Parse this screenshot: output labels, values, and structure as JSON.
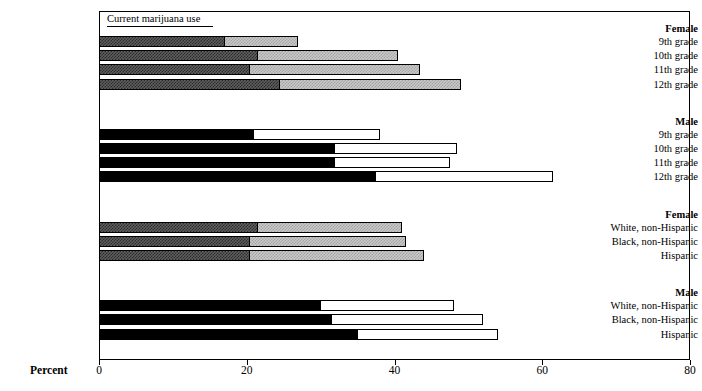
{
  "legend": {
    "label": "Current marijuana use"
  },
  "axis": {
    "xlabel": "Percent",
    "ticks": [
      {
        "value": 0,
        "text": "0"
      },
      {
        "value": 20,
        "text": "20"
      },
      {
        "value": 40,
        "text": "40"
      },
      {
        "value": 60,
        "text": "60"
      },
      {
        "value": 80,
        "text": "80"
      }
    ],
    "xmin": 0,
    "xmax": 80
  },
  "colors": {
    "female_dark": "#3f3f3f",
    "female_light": "#c0c0c0",
    "male_dark": "#000000",
    "male_light": "#ffffff",
    "outline": "#000000",
    "background": "#ffffff"
  },
  "groups": [
    {
      "id": "female-grade",
      "heading": "Female",
      "sex": "female",
      "rows": [
        {
          "label": "9th grade",
          "dark": 17.0,
          "light": 27.0
        },
        {
          "label": "10th grade",
          "dark": 21.5,
          "light": 40.5
        },
        {
          "label": "11th grade",
          "dark": 20.5,
          "light": 43.5
        },
        {
          "label": "12th grade",
          "dark": 24.5,
          "light": 49.0
        }
      ]
    },
    {
      "id": "male-grade",
      "heading": "Male",
      "sex": "male",
      "rows": [
        {
          "label": "9th grade",
          "dark": 21.0,
          "light": 38.0
        },
        {
          "label": "10th grade",
          "dark": 32.0,
          "light": 48.5
        },
        {
          "label": "11th grade",
          "dark": 32.0,
          "light": 47.5
        },
        {
          "label": "12th grade",
          "dark": 37.5,
          "light": 61.5
        }
      ]
    },
    {
      "id": "female-race",
      "heading": "Female",
      "sex": "female",
      "rows": [
        {
          "label": "White, non-Hispanic",
          "dark": 21.5,
          "light": 41.0
        },
        {
          "label": "Black, non-Hispanic",
          "dark": 20.5,
          "light": 41.5
        },
        {
          "label": "Hispanic",
          "dark": 20.5,
          "light": 44.0
        }
      ]
    },
    {
      "id": "male-race",
      "heading": "Male",
      "sex": "male",
      "rows": [
        {
          "label": "White, non-Hispanic",
          "dark": 30.0,
          "light": 48.0
        },
        {
          "label": "Black, non-Hispanic",
          "dark": 31.5,
          "light": 52.0
        },
        {
          "label": "Hispanic",
          "dark": 35.0,
          "light": 54.0
        }
      ]
    }
  ],
  "chart_data": {
    "type": "bar",
    "orientation": "horizontal",
    "title": "",
    "subtitle": "",
    "xlabel": "Percent",
    "ylabel": "",
    "xlim": [
      0,
      80
    ],
    "xticks": [
      0,
      20,
      40,
      60,
      80
    ],
    "grid": false,
    "legend": [
      "Current marijuana use"
    ],
    "legend_position": "top-left-inside",
    "note": "Each bar is a stacked/overlaid two-segment bar: an inner dark segment and an outer lighter segment whose right edge marks the total. Female panels use dithered gray fills; Male panels use solid black and white fills.",
    "categories": [
      "Female 9th grade",
      "Female 10th grade",
      "Female 11th grade",
      "Female 12th grade",
      "Male 9th grade",
      "Male 10th grade",
      "Male 11th grade",
      "Male 12th grade",
      "Female White, non-Hispanic",
      "Female Black, non-Hispanic",
      "Female Hispanic",
      "Male White, non-Hispanic",
      "Male Black, non-Hispanic",
      "Male Hispanic"
    ],
    "series": [
      {
        "name": "Inner (dark) segment",
        "values": [
          17.0,
          21.5,
          20.5,
          24.5,
          21.0,
          32.0,
          32.0,
          37.5,
          21.5,
          20.5,
          20.5,
          30.0,
          31.5,
          35.0
        ]
      },
      {
        "name": "Outer (light) segment end / total",
        "values": [
          27.0,
          40.5,
          43.5,
          49.0,
          38.0,
          48.5,
          47.5,
          61.5,
          41.0,
          41.5,
          44.0,
          48.0,
          52.0,
          54.0
        ]
      }
    ]
  }
}
